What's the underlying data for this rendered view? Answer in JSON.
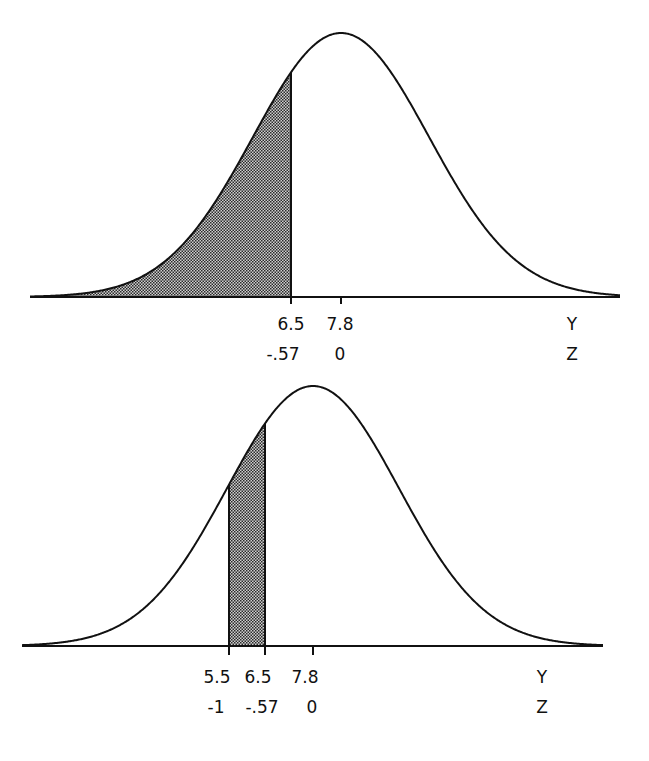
{
  "chart_data": [
    {
      "type": "area",
      "title": "",
      "description": "Normal curve with left tail shaded up to Y = 6.5",
      "mean_y": 7.8,
      "shade_from": null,
      "shade_to": 6.5,
      "x_ticks": [
        {
          "y": "6.5",
          "z": "-.57"
        },
        {
          "y": "7.8",
          "z": "0"
        }
      ],
      "axis_labels": {
        "y": "Y",
        "z": "Z"
      }
    },
    {
      "type": "area",
      "title": "",
      "description": "Normal curve with region between Y = 5.5 and Y = 6.5 shaded",
      "mean_y": 7.8,
      "shade_from": 5.5,
      "shade_to": 6.5,
      "x_ticks": [
        {
          "y": "5.5",
          "z": "-1"
        },
        {
          "y": "6.5",
          "z": "-.57"
        },
        {
          "y": "7.8",
          "z": "0"
        }
      ],
      "axis_labels": {
        "y": "Y",
        "z": "Z"
      }
    }
  ],
  "top": {
    "ticks": [
      {
        "y": "6.5",
        "z": "-.57"
      },
      {
        "y": "7.8",
        "z": "0"
      }
    ],
    "axis_y": "Y",
    "axis_z": "Z"
  },
  "bottom": {
    "ticks": [
      {
        "y": "5.5",
        "z": "-1"
      },
      {
        "y": "6.5",
        "z": "-.57"
      },
      {
        "y": "7.8",
        "z": "0"
      }
    ],
    "axis_y": "Y",
    "axis_z": "Z"
  },
  "colors": {
    "line": "#111111",
    "shade_dark": "#333333",
    "shade_light": "#d8d8d8"
  }
}
